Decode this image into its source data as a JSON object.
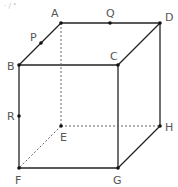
{
  "figure": {
    "type": "cube-diagram",
    "top_fragment": "· ∕ °",
    "colors": {
      "line": "#222222",
      "dashed": "#666666",
      "label": "#555555",
      "point": "#111111"
    },
    "vertices": {
      "A": {
        "label": "A",
        "x": 61,
        "y": 23,
        "lx": 51,
        "ly": 17
      },
      "B": {
        "label": "B",
        "x": 19,
        "y": 65,
        "lx": 7,
        "ly": 70
      },
      "C": {
        "label": "C",
        "x": 118,
        "y": 65,
        "lx": 110,
        "ly": 60
      },
      "D": {
        "label": "D",
        "x": 160,
        "y": 23,
        "lx": 165,
        "ly": 21
      },
      "E": {
        "label": "E",
        "x": 61,
        "y": 126,
        "lx": 60,
        "ly": 141
      },
      "F": {
        "label": "F",
        "x": 19,
        "y": 168,
        "lx": 15,
        "ly": 184
      },
      "G": {
        "label": "G",
        "x": 118,
        "y": 168,
        "lx": 113,
        "ly": 184
      },
      "H": {
        "label": "H",
        "x": 160,
        "y": 126,
        "lx": 165,
        "ly": 131
      }
    },
    "points": {
      "P": {
        "label": "P",
        "x": 41,
        "y": 43,
        "lx": 30,
        "ly": 41,
        "on": "AB"
      },
      "Q": {
        "label": "Q",
        "x": 110,
        "y": 23,
        "lx": 106,
        "ly": 17,
        "on": "AD"
      },
      "R": {
        "label": "R",
        "x": 19,
        "y": 116,
        "lx": 7,
        "ly": 120,
        "on": "BF"
      }
    },
    "solid_edges": [
      "AD",
      "AB",
      "BC",
      "CD",
      "BF",
      "CG",
      "DH",
      "FG",
      "GH"
    ],
    "dashed_edges": [
      "AE",
      "EH",
      "EF"
    ]
  }
}
